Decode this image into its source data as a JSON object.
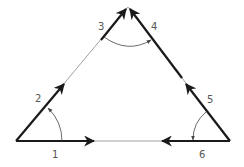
{
  "diagram": {
    "type": "triangle-vector-angles",
    "colors": {
      "stroke": "#1a1a1a",
      "thin_stroke": "#888888",
      "label": "#555555",
      "background": "#ffffff"
    },
    "vertices": {
      "bottom_left": [
        16,
        141
      ],
      "apex": [
        128,
        7
      ],
      "bottom_right": [
        230,
        141
      ]
    },
    "labels": [
      {
        "id": "1",
        "text": "1",
        "x": 52,
        "y": 158
      },
      {
        "id": "2",
        "text": "2",
        "x": 38,
        "y": 102
      },
      {
        "id": "3",
        "text": "3",
        "x": 101,
        "y": 31
      },
      {
        "id": "4",
        "text": "4",
        "x": 151,
        "y": 31
      },
      {
        "id": "5",
        "text": "5",
        "x": 209,
        "y": 103
      },
      {
        "id": "6",
        "text": "6",
        "x": 200,
        "y": 158
      }
    ]
  }
}
